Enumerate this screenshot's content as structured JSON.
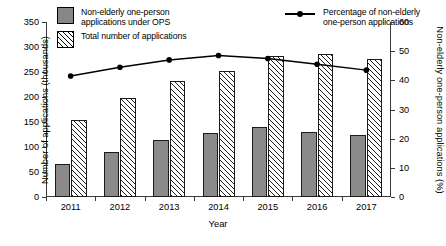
{
  "legend": {
    "series_solid_label": "Non-elderly one-person\napplications under OPS",
    "series_hatch_label": "Total number of applications",
    "series_line_label": "Percentage of non-elderly\none-person applications"
  },
  "axes": {
    "y_left_title": "Number of applications (thousands)",
    "y_right_title": "Non-elderly one-person applications (%)",
    "x_title": "Year",
    "y_left_ticks": [
      "0",
      "50",
      "100",
      "150",
      "200",
      "250",
      "300",
      "350"
    ],
    "y_right_ticks": [
      "0",
      "10",
      "20",
      "30",
      "40",
      "50",
      "60"
    ],
    "x_ticks": [
      "2011",
      "2012",
      "2013",
      "2014",
      "2015",
      "2016",
      "2017"
    ]
  },
  "colors": {
    "solid_bar": "#8a8a8a",
    "hatch_bar": "#ffffff",
    "line": "#000000",
    "axis": "#3a3a3a"
  },
  "chart_data": {
    "type": "bar",
    "title": "",
    "xlabel": "Year",
    "ylabel": "Number of applications (thousands)",
    "y2label": "Non-elderly one-person applications (%)",
    "categories": [
      "2011",
      "2012",
      "2013",
      "2014",
      "2015",
      "2016",
      "2017"
    ],
    "ylim": [
      0,
      350
    ],
    "y2lim": [
      0,
      60
    ],
    "grid": false,
    "legend_position": "top",
    "series": [
      {
        "name": "Non-elderly one-person applications under OPS",
        "type": "bar",
        "axis": "left",
        "values": [
          67,
          91,
          114,
          128,
          140,
          131,
          124
        ]
      },
      {
        "name": "Total number of applications",
        "type": "bar",
        "axis": "left",
        "values": [
          155,
          199,
          232,
          253,
          282,
          286,
          277
        ]
      },
      {
        "name": "Percentage of non-elderly one-person applications",
        "type": "line",
        "axis": "right",
        "values": [
          41.5,
          44.5,
          47.0,
          48.5,
          47.5,
          45.5,
          43.5
        ]
      }
    ]
  }
}
